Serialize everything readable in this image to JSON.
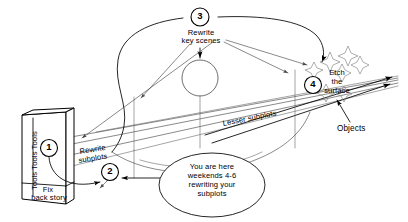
{
  "diagram": {
    "background_color": "#ffffff",
    "ink_color": "#000000",
    "width": 408,
    "height": 222
  },
  "steps": [
    {
      "id": "step-1",
      "number": "1",
      "label": ""
    },
    {
      "id": "step-2",
      "number": "2",
      "label": ""
    },
    {
      "id": "step-3",
      "number": "3",
      "label": "Rewrite\nkey scenes"
    },
    {
      "id": "step-4",
      "number": "4",
      "label": "Etch\nthe\nsurface"
    }
  ],
  "labels": {
    "tools_box_side": "Tools Tools Tools",
    "tools_box_bottom": "Fix\nback story",
    "rewrite_key_scenes_line1": "Rewrite",
    "rewrite_key_scenes_line2": "key scenes",
    "rewrite_subplots_line1": "Rewrite",
    "rewrite_subplots_line2": "subplots",
    "lesser_subplots": "Lesser subplots",
    "etch_line1": "Etch",
    "etch_line2": "the",
    "etch_line3": "surface",
    "objects": "Objects",
    "callout_line1": "You are here",
    "callout_line2": "weekends 4-6",
    "callout_line3": "rewriting your",
    "callout_line4": "subplots"
  },
  "numbers": {
    "one": "1",
    "two": "2",
    "three": "3",
    "four": "4"
  }
}
